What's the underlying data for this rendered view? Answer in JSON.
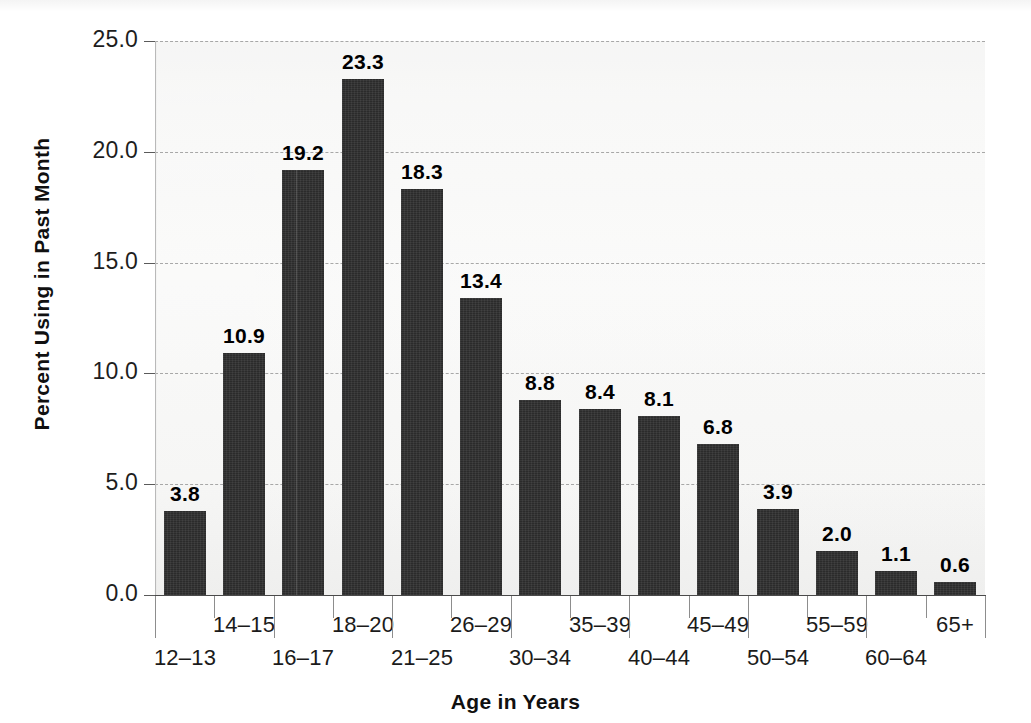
{
  "chart_data": {
    "type": "bar",
    "title": "",
    "xlabel": "Age in Years",
    "ylabel": "Percent Using in Past Month",
    "categories": [
      "12–13",
      "14–15",
      "16–17",
      "18–20",
      "21–25",
      "26–29",
      "30–34",
      "35–39",
      "40–44",
      "45–49",
      "50–54",
      "55–59",
      "60–64",
      "65+"
    ],
    "values": [
      3.8,
      10.9,
      19.2,
      23.3,
      18.3,
      13.4,
      8.8,
      8.4,
      8.1,
      6.8,
      3.9,
      2.0,
      1.1,
      0.6
    ],
    "value_labels": [
      "3.8",
      "10.9",
      "19.2",
      "23.3",
      "18.3",
      "13.4",
      "8.8",
      "8.4",
      "8.1",
      "6.8",
      "3.9",
      "2.0",
      "1.1",
      "0.6"
    ],
    "ylim": [
      0,
      25
    ],
    "ytick_values": [
      0,
      5,
      10,
      15,
      20,
      25
    ],
    "ytick_labels": [
      "0.0",
      "5.0",
      "10.0",
      "15.0",
      "20.0",
      "25.0"
    ],
    "grid": true,
    "legend": "none",
    "bar_color": "#2b2b2b",
    "plot_background": "#f7f7f6",
    "gridline_color": "#9a9a9a"
  }
}
